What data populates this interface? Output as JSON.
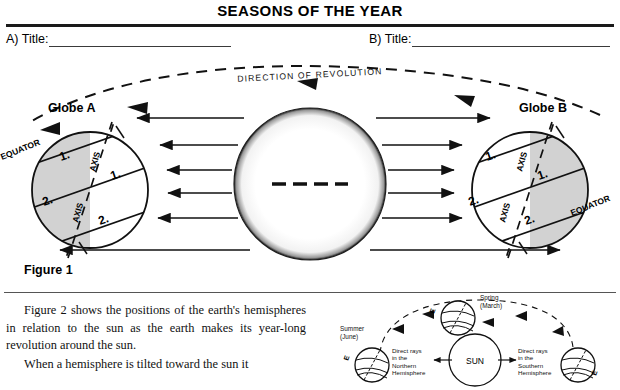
{
  "header": {
    "worksheet_title": "SEASONS OF THE YEAR",
    "fields": [
      {
        "id": "a",
        "label": "A)  Title:"
      },
      {
        "id": "b",
        "label": "B)  Title:"
      }
    ]
  },
  "figure1": {
    "caption": "Figure 1",
    "revolution_label": "DIRECTION OF REVOLUTION",
    "globe_a": {
      "name": "Globe A",
      "equator_label": "EQUATOR",
      "axis_label_upper": "AXIS",
      "axis_label_lower": "AXIS",
      "band_label_shaded_upper": "1.",
      "band_label_shaded_lower": "2.",
      "band_label_lit_upper": "1.",
      "band_label_lit_lower": "2.",
      "shaded_side": "left"
    },
    "globe_b": {
      "name": "Globe B",
      "equator_label": "EQUATOR",
      "axis_label_upper": "AXIS",
      "axis_label_lower": "AXIS",
      "band_label_lit_upper": "1.",
      "band_label_lit_lower": "2.",
      "band_label_shaded_upper": "1.",
      "band_label_shaded_lower": "2.",
      "shaded_side": "right"
    },
    "sun": {
      "name": "sun",
      "center_marker": "dashed-line"
    },
    "ray_count_left": 6,
    "ray_count_right": 6
  },
  "body": {
    "paragraphs": [
      "Figure 2  shows the positions of the earth's hemispheres in relation to the sun as the earth makes its year-long revolution around the sun.",
      "When a hemisphere is tilted toward the sun it"
    ]
  },
  "figure2": {
    "sun_label": "SUN",
    "season_top": "Spring\n(March)",
    "season_top_line1": "Spring",
    "season_top_line2": "(March)",
    "season_left_line1": "Summer",
    "season_left_line2": "(June)",
    "rays_left_line1": "Direct rays",
    "rays_left_line2": "in the",
    "rays_left_line3": "Northern",
    "rays_left_line4": "Hemisphere",
    "rays_right_line1": "Direct rays",
    "rays_right_line2": "in the",
    "rays_right_line3": "Southern",
    "rays_right_line4": "Hemisphere",
    "globe_marker": "E"
  },
  "colors": {
    "ink": "#000000",
    "rule": "#1a1a1a",
    "shade": "#d0d0d0",
    "blank_line": "#3a3a3a"
  }
}
